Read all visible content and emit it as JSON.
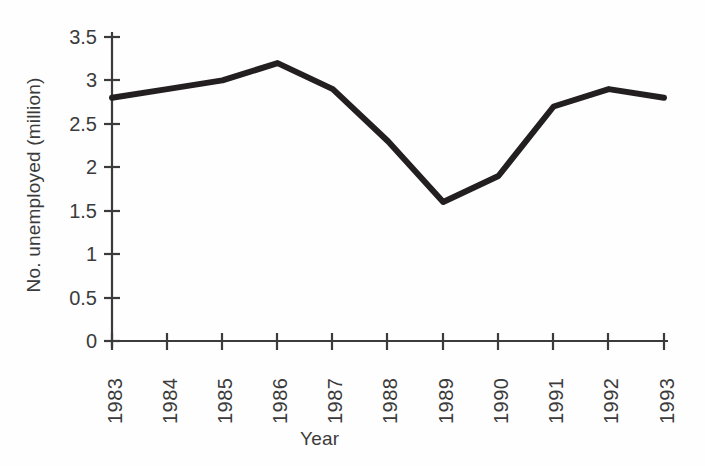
{
  "chart_data": {
    "type": "line",
    "title": "",
    "xlabel": "Year",
    "ylabel": "No. unemployed (million)",
    "categories": [
      "1983",
      "1984",
      "1985",
      "1986",
      "1987",
      "1988",
      "1989",
      "1990",
      "1991",
      "1992",
      "1993"
    ],
    "x": [
      1983,
      1984,
      1985,
      1986,
      1987,
      1988,
      1989,
      1990,
      1991,
      1992,
      1993
    ],
    "values": [
      2.8,
      2.9,
      3.0,
      3.2,
      2.9,
      2.3,
      1.6,
      1.9,
      2.7,
      2.9,
      2.8
    ],
    "series": [
      {
        "name": "No. unemployed (million)",
        "values": [
          2.8,
          2.9,
          3.0,
          3.2,
          2.9,
          2.3,
          1.6,
          1.9,
          2.7,
          2.9,
          2.8
        ]
      }
    ],
    "ylim": [
      0,
      3.5
    ],
    "yticks": [
      0,
      0.5,
      1,
      1.5,
      2,
      2.5,
      3,
      3.5
    ],
    "ytick_labels": [
      "0",
      "0.5",
      "1",
      "1.5",
      "2",
      "2.5",
      "3",
      "3.5"
    ],
    "grid": false,
    "legend": false,
    "legend_position": "none",
    "line_color": "#231f20",
    "axis_color": "#3b3b3b",
    "background_color": "#fefefe"
  }
}
